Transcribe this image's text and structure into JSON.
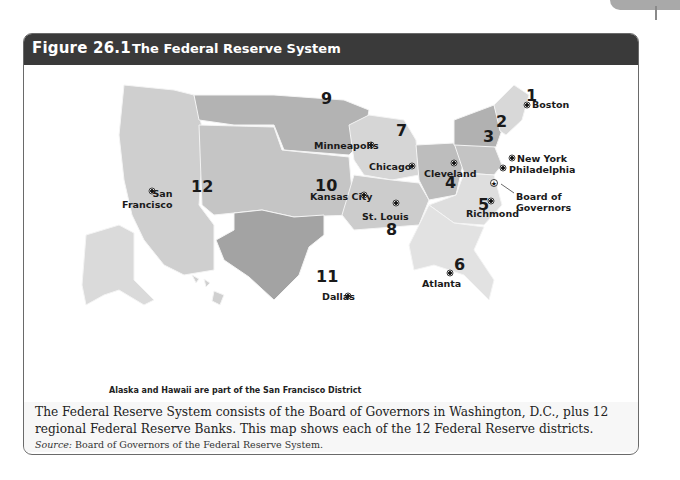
{
  "header": {
    "figure_number": "Figure 26.1",
    "title": "The Federal Reserve System"
  },
  "map": {
    "colors": {
      "district_dark": "#9a9a9a",
      "district_mid": "#b5b5b5",
      "district_light": "#cfcfcf",
      "district_lighter": "#dcdcdc",
      "state_border": "#f4f4f4"
    },
    "districts": [
      {
        "number": "1",
        "city": "Boston"
      },
      {
        "number": "2",
        "city": "New York"
      },
      {
        "number": "3",
        "city": "Philadelphia"
      },
      {
        "number": "4",
        "city": "Cleveland"
      },
      {
        "number": "5",
        "city": "Richmond"
      },
      {
        "number": "6",
        "city": "Atlanta"
      },
      {
        "number": "7",
        "city": "Chicago"
      },
      {
        "number": "8",
        "city": "St. Louis"
      },
      {
        "number": "9",
        "city": "Minneapolis"
      },
      {
        "number": "10",
        "city": "Kansas City"
      },
      {
        "number": "11",
        "city": "Dallas"
      },
      {
        "number": "12",
        "city": "San Francisco"
      }
    ],
    "sf_label_line1": "San",
    "sf_label_line2": "Francisco",
    "board_label_line1": "Board of",
    "board_label_line2": "Governors",
    "note": "Alaska and Hawaii are part of the San Francisco District"
  },
  "caption": {
    "text": "The Federal Reserve System consists of the Board of Governors in Washington, D.C., plus 12 regional Federal Reserve Banks. This map shows each of the 12 Federal Reserve districts.",
    "source_label": "Source:",
    "source_text": " Board of Governors of the Federal Reserve System."
  }
}
